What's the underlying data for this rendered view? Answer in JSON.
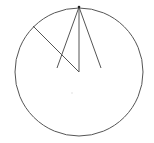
{
  "diagram": {
    "background": "#ffffff",
    "stroke_color": "#555555",
    "circle": {
      "cx": 79,
      "cy": 72,
      "r": 64
    },
    "lines": [
      {
        "x1": 79,
        "y1": 7,
        "x2": 79,
        "y2": 72
      },
      {
        "x1": 79,
        "y1": 7,
        "x2": 57,
        "y2": 68
      },
      {
        "x1": 79,
        "y1": 7,
        "x2": 101,
        "y2": 68
      },
      {
        "x1": 33,
        "y1": 26,
        "x2": 79,
        "y2": 72
      }
    ],
    "apex_point": {
      "cx": 79,
      "cy": 7
    },
    "faint_dot": {
      "cx": 72,
      "cy": 93
    }
  }
}
